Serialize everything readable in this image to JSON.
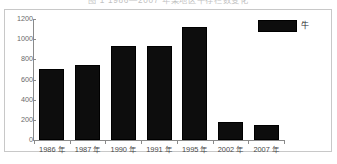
{
  "caption": {
    "text": "图 1  1986—2007 年某地区牛存栏数变化"
  },
  "legend": {
    "position": "top-right",
    "entries": [
      {
        "label": "牛",
        "color": "#0d0d0d",
        "swatch": "filled-square"
      }
    ]
  },
  "axes": {
    "y_ticks": [
      "1200",
      "1000",
      "800",
      "600",
      "400",
      "200",
      "0"
    ],
    "x_ticks": [
      "1986 年",
      "1987 年",
      "1990 年",
      "1991 年",
      "1995 年",
      "2002 年",
      "2007 年"
    ]
  },
  "chart_data": {
    "type": "bar",
    "title": "图 1  1986—2007 年某地区牛存栏数变化",
    "xlabel": "",
    "ylabel": "",
    "categories": [
      "1986 年",
      "1987 年",
      "1990 年",
      "1991 年",
      "1995 年",
      "2002 年",
      "2007 年"
    ],
    "series": [
      {
        "name": "牛",
        "color": "#0d0d0d",
        "values": [
          700,
          745,
          930,
          930,
          1120,
          178,
          145
        ]
      }
    ],
    "ylim": [
      0,
      1200
    ],
    "ytick_values": [
      0,
      200,
      400,
      600,
      800,
      1000,
      1200
    ],
    "grid": false,
    "legend_position": "top-right"
  }
}
